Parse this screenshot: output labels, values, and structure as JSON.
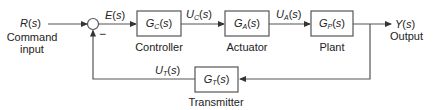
{
  "diagram": {
    "type": "feedback-control-block-diagram",
    "input": {
      "signal": "R",
      "arg": "s",
      "label_line1": "Command",
      "label_line2": "input"
    },
    "output": {
      "signal": "Y",
      "arg": "s",
      "label": "Output"
    },
    "summing_junction": {
      "feedback_sign": "−"
    },
    "signals": {
      "error": {
        "name": "E",
        "arg": "s"
      },
      "controller_out": {
        "name": "U",
        "sub": "C",
        "arg": "s"
      },
      "actuator_out": {
        "name": "U",
        "sub": "A",
        "arg": "s"
      },
      "transmitter_out": {
        "name": "U",
        "sub": "T",
        "arg": "s"
      }
    },
    "blocks": [
      {
        "id": "controller",
        "tf": "G",
        "sub": "C",
        "arg": "s",
        "label": "Controller"
      },
      {
        "id": "actuator",
        "tf": "G",
        "sub": "A",
        "arg": "s",
        "label": "Actuator"
      },
      {
        "id": "plant",
        "tf": "G",
        "sub": "P",
        "arg": "s",
        "label": "Plant"
      },
      {
        "id": "transmitter",
        "tf": "G",
        "sub": "T",
        "arg": "s",
        "label": "Transmitter"
      }
    ],
    "colors": {
      "line": "#555555",
      "text": "#222222"
    }
  }
}
